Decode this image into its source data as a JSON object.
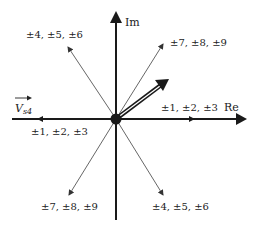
{
  "diagram": {
    "axes": {
      "real_label": "Re",
      "imag_label": "Im"
    },
    "vector_label": {
      "main": "V",
      "subscript": "s4"
    },
    "vectors": [
      {
        "direction": "right",
        "label": "±1, ±2, ±3"
      },
      {
        "direction": "left",
        "label": "±1, ±2, ±3"
      },
      {
        "direction": "upper-left",
        "label": "±4, ±5, ±6"
      },
      {
        "direction": "lower-right",
        "label": "±4, ±5, ±6"
      },
      {
        "direction": "upper-right",
        "label": "±7, ±8, ±9"
      },
      {
        "direction": "lower-left",
        "label": "±7, ±8, ±9"
      }
    ],
    "colors": {
      "line": "#1a1a1a",
      "thin_line": "#555555",
      "background": "#ffffff"
    }
  }
}
